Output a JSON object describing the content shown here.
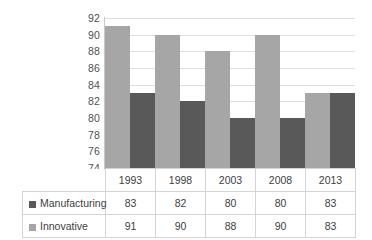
{
  "chart_data": {
    "type": "bar",
    "title": "",
    "subtitle": "",
    "xlabel": "",
    "ylabel": "",
    "categories": [
      "1993",
      "1998",
      "2003",
      "2008",
      "2013"
    ],
    "series": [
      {
        "name": "Manufacturing",
        "values": [
          83,
          82,
          80,
          80,
          83
        ],
        "color": "#595959",
        "legend_marker": "square"
      },
      {
        "name": "Innovative",
        "values": [
          91,
          90,
          88,
          90,
          83
        ],
        "color": "#a6a6a6",
        "legend_marker": "square"
      }
    ],
    "ylim": [
      74,
      92
    ],
    "ytick_step": 2,
    "yticks": [
      "92",
      "90",
      "88",
      "86",
      "84",
      "82",
      "80",
      "78",
      "76",
      "74"
    ],
    "grid": true,
    "grid_color": "#dedede",
    "legend_position": "data-table-left",
    "data_table_visible": true,
    "annotations": []
  },
  "table": {
    "header_blank": "",
    "category_row": [
      "1993",
      "1998",
      "2003",
      "2008",
      "2013"
    ],
    "rows": [
      {
        "label": "Manufacturing",
        "marker_class": "dark",
        "values": [
          "83",
          "82",
          "80",
          "80",
          "83"
        ]
      },
      {
        "label": "Innovative",
        "marker_class": "light",
        "values": [
          "91",
          "90",
          "88",
          "90",
          "83"
        ]
      }
    ]
  },
  "colors": {
    "manufacturing": "#595959",
    "innovative": "#a6a6a6",
    "gridline": "#dedede",
    "table_border": "#d4d4d4",
    "text": "#404040",
    "background": "#ffffff"
  }
}
